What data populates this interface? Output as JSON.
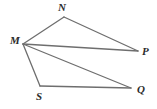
{
  "figure": {
    "background_color": "#ffffff",
    "stroke_color": "#6e6e6e",
    "label_color": "#2b2b2b",
    "stroke_width": 1.3,
    "width": 157,
    "height": 109,
    "points": [
      {
        "id": "M",
        "label": "M",
        "x": 23,
        "y": 44
      },
      {
        "id": "N",
        "label": "N",
        "x": 64,
        "y": 17
      },
      {
        "id": "P",
        "label": "P",
        "x": 138,
        "y": 51
      },
      {
        "id": "S",
        "label": "S",
        "x": 40,
        "y": 86
      },
      {
        "id": "Q",
        "label": "Q",
        "x": 131,
        "y": 88
      }
    ],
    "segments": [
      {
        "id": "MN",
        "from": "M",
        "to": "N",
        "x1": 23,
        "y1": 44,
        "x2": 64,
        "y2": 17
      },
      {
        "id": "NP",
        "from": "N",
        "to": "P",
        "x1": 64,
        "y1": 17,
        "x2": 138,
        "y2": 51
      },
      {
        "id": "MP",
        "from": "M",
        "to": "P",
        "x1": 23,
        "y1": 44,
        "x2": 138,
        "y2": 51
      },
      {
        "id": "MQ",
        "from": "M",
        "to": "Q",
        "x1": 23,
        "y1": 44,
        "x2": 131,
        "y2": 88
      },
      {
        "id": "MS",
        "from": "M",
        "to": "S",
        "x1": 23,
        "y1": 44,
        "x2": 40,
        "y2": 86
      },
      {
        "id": "SQ",
        "from": "S",
        "to": "Q",
        "x1": 40,
        "y1": 86,
        "x2": 131,
        "y2": 88
      }
    ]
  }
}
